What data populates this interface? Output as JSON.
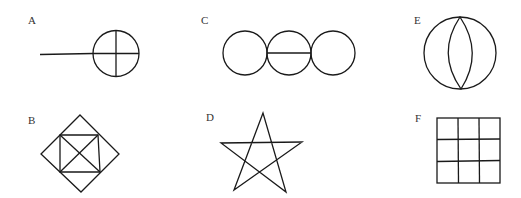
{
  "figures": [
    {
      "id": "A",
      "label": "A",
      "description": "Circle divided into quadrants by a cross, with a horizontal line extending to the left"
    },
    {
      "id": "B",
      "label": "B",
      "description": "Diamond containing an inscribed square with both diagonals drawn"
    },
    {
      "id": "C",
      "label": "C",
      "description": "Three touching circles in a row, with a horizontal diameter in the middle circle"
    },
    {
      "id": "D",
      "label": "D",
      "description": "Five-pointed star (pentagram)"
    },
    {
      "id": "E",
      "label": "E",
      "description": "Circle with a vertical lens (vesica) shape inside spanning top to bottom"
    },
    {
      "id": "F",
      "label": "F",
      "description": "Square divided into a 3x3 grid"
    }
  ]
}
